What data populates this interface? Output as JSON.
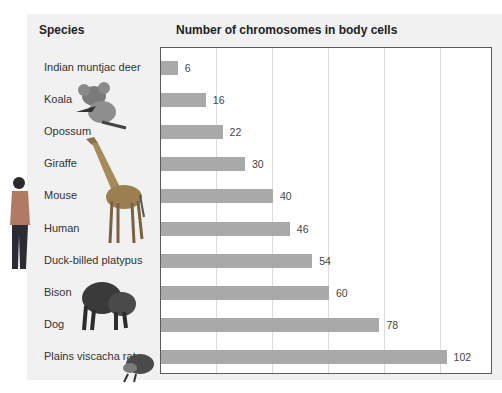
{
  "headers": {
    "species": "Species",
    "chart_title": "Number of chromosomes in body cells"
  },
  "rows": [
    {
      "species": "Indian muntjac deer",
      "value": "6"
    },
    {
      "species": "Koala",
      "value": "16"
    },
    {
      "species": "Opossum",
      "value": "22"
    },
    {
      "species": "Giraffe",
      "value": "30"
    },
    {
      "species": "Mouse",
      "value": "40"
    },
    {
      "species": "Human",
      "value": "46"
    },
    {
      "species": "Duck-billed platypus",
      "value": "54"
    },
    {
      "species": "Bison",
      "value": "60"
    },
    {
      "species": "Dog",
      "value": "78"
    },
    {
      "species": "Plains viscacha rat",
      "value": "102"
    }
  ],
  "illustrations": [
    "koala-image",
    "giraffe-image",
    "human-image",
    "bison-image",
    "viscacha-rat-image"
  ],
  "colors": {
    "bar": "#a9a9a9",
    "panel": "#f1f1f1",
    "grid": "#dcdcdc",
    "border": "#5a5a5a"
  },
  "chart_data": {
    "type": "bar",
    "orientation": "horizontal",
    "title": "Number of chromosomes in body cells",
    "xlabel": "Number of chromosomes in body cells",
    "ylabel": "Species",
    "categories": [
      "Indian muntjac deer",
      "Koala",
      "Opossum",
      "Giraffe",
      "Mouse",
      "Human",
      "Duck-billed platypus",
      "Bison",
      "Dog",
      "Plains viscacha rat"
    ],
    "values": [
      6,
      16,
      22,
      30,
      40,
      46,
      54,
      60,
      78,
      102
    ],
    "xlim": [
      0,
      118
    ],
    "gridlines_x": [
      20,
      40,
      60,
      80,
      100
    ],
    "grid": true,
    "data_labels": true,
    "legend": null
  }
}
